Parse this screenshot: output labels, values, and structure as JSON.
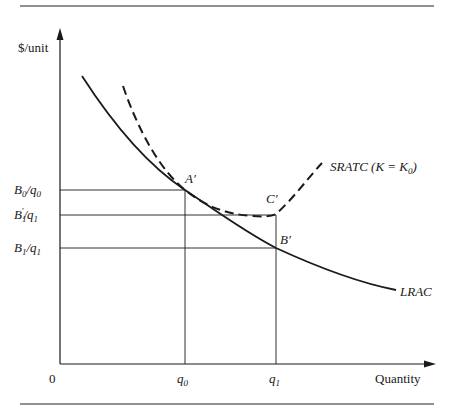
{
  "diagram": {
    "type": "economics cost curves",
    "axes": {
      "y_label": "$/unit",
      "x_label": "Quantity",
      "origin_label": "0"
    },
    "x_ticks": [
      {
        "base": "q",
        "sub": "0",
        "name": "q0"
      },
      {
        "base": "q",
        "sub": "1",
        "name": "q1"
      }
    ],
    "y_ticks": [
      {
        "text_a": "B",
        "sub_a": "0",
        "prime": "",
        "text_b": "/q",
        "sub_b": "0",
        "name": "B0/q0"
      },
      {
        "text_a": "B",
        "sub_a": "1",
        "prime": "′",
        "text_b": "/q",
        "sub_b": "1",
        "name": "B1'/q1"
      },
      {
        "text_a": "B",
        "sub_a": "1",
        "prime": "",
        "text_b": "/q",
        "sub_b": "1",
        "name": "B1/q1"
      }
    ],
    "points": {
      "a": "A′",
      "b": "B′",
      "c": "C′"
    },
    "curves": {
      "lrac": {
        "label": "LRAC",
        "style": "solid"
      },
      "sratc": {
        "label_main": "SRATC (K = K",
        "label_sub": "0",
        "label_end": ")",
        "style": "dashed"
      }
    },
    "colors": {
      "ink": "#1a1a1a",
      "background": "#ffffff"
    }
  }
}
